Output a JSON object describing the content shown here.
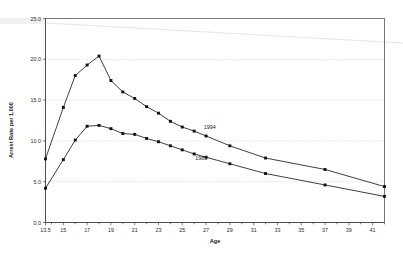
{
  "chart_data": {
    "type": "line",
    "title": "",
    "xlabel": "Age",
    "ylabel": "Arrest Rate per 1,000",
    "xlim": [
      13.5,
      42
    ],
    "ylim": [
      0.0,
      25.0
    ],
    "grid": true,
    "legend_position": "inline-annotation",
    "y_ticks": [
      "0.0",
      "5.0",
      "10.0",
      "15.0",
      "20.0",
      "25.0"
    ],
    "y_tick_values": [
      0.0,
      5.0,
      10.0,
      15.0,
      20.0,
      25.0
    ],
    "x_ticks": [
      "13.5",
      "15",
      "17",
      "19",
      "21",
      "23",
      "25",
      "27",
      "29",
      "31",
      "33",
      "35",
      "37",
      "39",
      "41"
    ],
    "x_tick_values": [
      13.5,
      15,
      17,
      19,
      21,
      23,
      25,
      27,
      29,
      31,
      33,
      35,
      37,
      39,
      41
    ],
    "x_minor_ticks": [
      14,
      16,
      18,
      20,
      22,
      24,
      26,
      28,
      30,
      32,
      34,
      36,
      38,
      40,
      42
    ],
    "series": [
      {
        "name": "1994",
        "label": "1994",
        "color": "#1d1d1d",
        "x": [
          13.5,
          15,
          16,
          17,
          18,
          19,
          20,
          21,
          22,
          23,
          24,
          25,
          26,
          27,
          29,
          32,
          37,
          42
        ],
        "values": [
          7.8,
          14.1,
          18.0,
          19.3,
          20.4,
          17.4,
          16.0,
          15.2,
          14.2,
          13.4,
          12.4,
          11.7,
          11.2,
          10.6,
          9.4,
          7.9,
          6.5,
          4.4
        ]
      },
      {
        "name": "1985",
        "label": "1985",
        "color": "#1d1d1d",
        "x": [
          13.5,
          15,
          16,
          17,
          18,
          19,
          20,
          21,
          22,
          23,
          24,
          25,
          26,
          27,
          29,
          32,
          37,
          42
        ],
        "values": [
          4.2,
          7.7,
          10.1,
          11.8,
          11.9,
          11.5,
          10.9,
          10.8,
          10.3,
          9.9,
          9.4,
          8.9,
          8.4,
          8.0,
          7.2,
          6.0,
          4.6,
          3.2
        ]
      }
    ],
    "annotations": [
      {
        "text": "1994",
        "x": 27.3,
        "y": 11.4
      },
      {
        "text": "1985",
        "x": 26.6,
        "y": 7.6
      }
    ]
  }
}
